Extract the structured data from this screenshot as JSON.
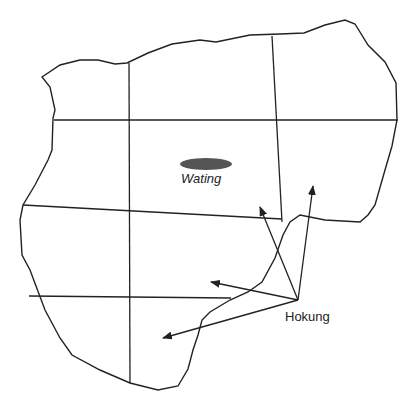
{
  "map": {
    "width": 412,
    "height": 399,
    "colors": {
      "background": "#ffffff",
      "line": "#222222",
      "lake": "#555555",
      "text": "#222222"
    },
    "places": [
      {
        "name": "Wating",
        "type": "lake",
        "style": "italic"
      },
      {
        "name": "Hokung",
        "type": "town",
        "style": "normal"
      }
    ],
    "arrows_from": "Hokung",
    "arrow_count": 4
  }
}
